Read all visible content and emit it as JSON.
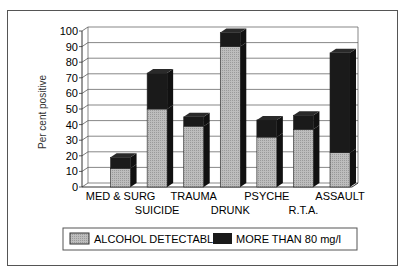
{
  "chart_data": {
    "type": "bar",
    "stacked": true,
    "style": "3d",
    "title": "",
    "xlabel": "",
    "ylabel": "Per cent positive",
    "ylim": [
      0,
      100
    ],
    "yticks": [
      0,
      10,
      20,
      30,
      40,
      50,
      60,
      70,
      80,
      90,
      100
    ],
    "grid": true,
    "legend_position": "bottom",
    "categories": [
      "MED & SURG",
      "SUICIDE",
      "TRAUMA",
      "DRUNK",
      "PSYCHE",
      "R.T.A.",
      "ASSAULT"
    ],
    "series": [
      {
        "name": "ALCOHOL DETECTABLE",
        "color": "#b4b4b4",
        "values": [
          12,
          50,
          39,
          90,
          32,
          37,
          22
        ]
      },
      {
        "name": "MORE THAN 80 mg/l",
        "color": "#1a1a1a",
        "values": [
          7,
          23,
          6,
          9,
          11,
          9,
          64
        ]
      }
    ],
    "totals": [
      19,
      73,
      45,
      99,
      43,
      46,
      86
    ]
  }
}
